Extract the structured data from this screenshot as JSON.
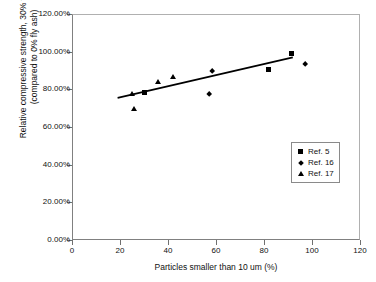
{
  "chart_data": {
    "type": "scatter",
    "title": "",
    "xlabel": "Particles smaller than 10 um (%)",
    "ylabel_line1": "Relative compressive strength, 30%  fly ash",
    "ylabel_line2": "(compared to 0% fly ash)",
    "xlim": [
      0,
      120
    ],
    "ylim": [
      0,
      1.2
    ],
    "xticks": [
      0,
      20,
      40,
      60,
      80,
      100,
      120
    ],
    "xtick_labels": [
      "0",
      "20",
      "40",
      "60",
      "80",
      "100",
      "120"
    ],
    "yticks": [
      0,
      0.2,
      0.4,
      0.6,
      0.8,
      1.0,
      1.2
    ],
    "ytick_labels": [
      "0.00%",
      "20.00%",
      "40.00%",
      "60.00%",
      "80.00%",
      "100.00%",
      "120.00%"
    ],
    "grid": false,
    "legend_position": "right-middle",
    "series": [
      {
        "name": "Ref. 5",
        "marker": "square",
        "color": "#000000",
        "points": [
          {
            "x": 30.0,
            "y": 0.785
          },
          {
            "x": 82.0,
            "y": 0.905
          },
          {
            "x": 91.5,
            "y": 0.99
          }
        ]
      },
      {
        "name": "Ref. 16",
        "marker": "diamond",
        "color": "#000000",
        "points": [
          {
            "x": 57.0,
            "y": 0.775
          },
          {
            "x": 58.5,
            "y": 0.895
          },
          {
            "x": 97.0,
            "y": 0.935
          }
        ]
      },
      {
        "name": "Ref. 17",
        "marker": "triangle",
        "color": "#000000",
        "points": [
          {
            "x": 25.0,
            "y": 0.777
          },
          {
            "x": 26.0,
            "y": 0.695
          },
          {
            "x": 36.0,
            "y": 0.84
          },
          {
            "x": 42.0,
            "y": 0.866
          }
        ]
      }
    ],
    "trendline": {
      "name": "linear-trend",
      "color": "#000000",
      "x0": 19.0,
      "y0": 0.755,
      "x1": 92.0,
      "y1": 0.97
    }
  },
  "legend": {
    "items": [
      {
        "label": "Ref. 5",
        "marker": "square"
      },
      {
        "label": "Ref. 16",
        "marker": "diamond"
      },
      {
        "label": "Ref. 17",
        "marker": "triangle"
      }
    ]
  }
}
